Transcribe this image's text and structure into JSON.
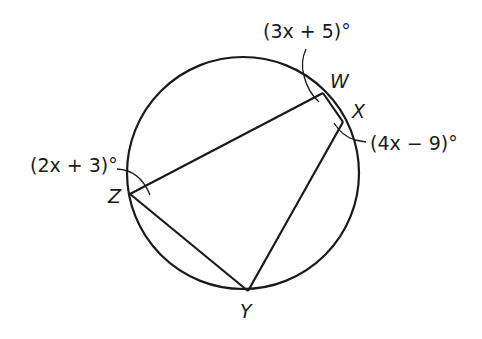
{
  "diagram": {
    "type": "inscribed-quadrilateral",
    "circle": {
      "cx": 243,
      "cy": 173,
      "r": 116
    },
    "points": {
      "W": {
        "label": "W",
        "x": 323,
        "y": 93
      },
      "X": {
        "label": "X",
        "x": 343,
        "y": 122
      },
      "Y": {
        "label": "Y",
        "x": 248,
        "y": 291
      },
      "Z": {
        "label": "Z",
        "x": 130,
        "y": 194
      }
    },
    "segments": [
      "ZW",
      "WX",
      "XY",
      "YZ"
    ],
    "angles": {
      "W": {
        "measure": "(3x + 5)°"
      },
      "X": {
        "measure": "(4x − 9)°"
      },
      "Z": {
        "measure": "(2x + 3)°"
      }
    },
    "colors": {
      "stroke": "#1a1a1a",
      "background": "#ffffff"
    }
  }
}
